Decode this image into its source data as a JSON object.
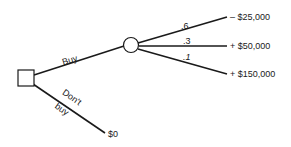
{
  "diagram": {
    "type": "decision-tree",
    "decision_node": {
      "shape": "square"
    },
    "chance_node": {
      "shape": "circle"
    },
    "branches": {
      "buy": {
        "label": "Buy"
      },
      "dont_buy": {
        "label_line1": "Don't",
        "label_line2": "buy",
        "outcome": "$0"
      }
    },
    "chance_branches": [
      {
        "probability": ".6",
        "outcome": "– $25,000"
      },
      {
        "probability": ".3",
        "outcome": "+ $50,000"
      },
      {
        "probability": ".1",
        "outcome": "+ $150,000"
      }
    ]
  }
}
